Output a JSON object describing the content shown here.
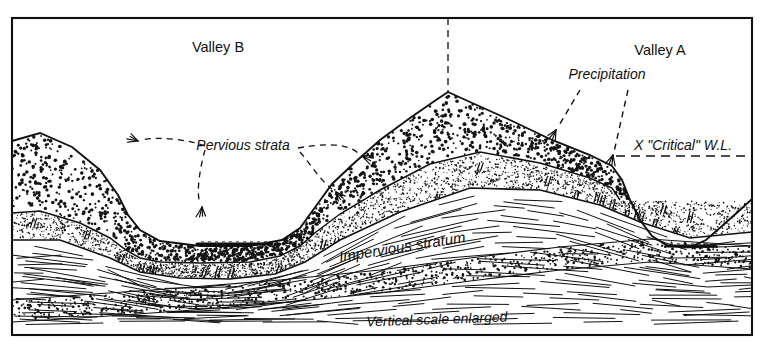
{
  "figure": {
    "title_caption": "Vertical scale enlarged",
    "frame": {
      "x": 12,
      "y": 18,
      "width": 740,
      "height": 317
    },
    "background_color": "#ffffff",
    "ink_color": "#101010"
  },
  "labels": {
    "valley_b": "Valley B",
    "valley_a": "Valley A",
    "precipitation": "Precipitation",
    "pervious_strata": "Pervious strata",
    "impervious_stratum": "Impervious stratum",
    "critical_wl": "X \"Critical\" W.L.",
    "vertical_scale": "Vertical scale enlarged"
  },
  "label_positions": {
    "valley_b": {
      "x": 218,
      "y": 52
    },
    "valley_a": {
      "x": 660,
      "y": 55
    },
    "precipitation": {
      "x": 607,
      "y": 79
    },
    "pervious_strata": {
      "x": 243,
      "y": 150
    },
    "impervious_stratum": {
      "x": 403,
      "y": 252
    },
    "critical_wl": {
      "x": 683,
      "y": 150
    },
    "vertical_scale": {
      "x": 437,
      "y": 324
    }
  },
  "label_styles": {
    "valley_b": {
      "size": 14.5,
      "italic": false,
      "anchor": "middle",
      "rotate": 0
    },
    "valley_a": {
      "size": 14.5,
      "italic": false,
      "anchor": "middle",
      "rotate": 0
    },
    "precipitation": {
      "size": 14,
      "italic": true,
      "anchor": "middle",
      "rotate": 0
    },
    "pervious_strata": {
      "size": 14,
      "italic": true,
      "anchor": "middle",
      "rotate": 0
    },
    "impervious_stratum": {
      "size": 15,
      "italic": true,
      "anchor": "middle",
      "rotate": -9
    },
    "critical_wl": {
      "size": 14,
      "italic": true,
      "anchor": "middle",
      "rotate": 0
    },
    "vertical_scale": {
      "size": 14,
      "italic": true,
      "anchor": "middle",
      "rotate": -2
    }
  },
  "geometry": {
    "ground_surface": "M 12,141 L 40,133 L 72,147 L 100,170 L 118,195 L 128,215 L 140,230 L 160,241 L 200,246 L 250,246 L 282,240 L 300,228 L 316,206 L 332,184 L 352,165 L 380,140 L 410,118 L 436,100 L 448,92 L 470,102 L 510,120 L 552,140 L 590,155 L 612,166 L 622,180 L 630,200 L 640,220 L 652,236 L 668,246 L 690,247 L 706,240 L 722,226 L 740,210 L 752,199",
    "pervious_lower_boundary": "M 12,213 L 40,211 L 80,223 L 110,238 L 126,250 L 140,258 L 160,262 L 200,263 L 250,262 L 280,256 L 300,246 L 316,232 L 340,214 L 380,190 L 430,164 L 480,152 L 540,163 L 590,178 L 612,188 L 620,200",
    "impervious_top": "M 12,240 L 60,240 L 110,258 L 140,272 L 180,278 L 230,279 L 275,274 L 305,262 L 340,240 L 400,212 L 470,188 L 540,190 L 600,205 L 640,222 L 690,238 L 752,232",
    "sand_band_top": "M 12,300 L 80,295 L 180,288 L 280,280 L 380,270 L 470,258 L 560,247 L 650,239 L 752,246",
    "sand_band_bottom": "M 12,322 L 80,318 L 180,311 L 280,303 L 380,293 L 470,281 L 560,270 L 650,262 L 752,269",
    "valley_b_water": {
      "x1": 197,
      "x2": 272,
      "y": 244
    },
    "valley_a_water": {
      "x1": 666,
      "x2": 715,
      "y": 246
    },
    "divider_line": {
      "x": 448,
      "y1": 18,
      "y2": 92
    },
    "critical_wl_line": {
      "x1": 616,
      "x2": 752,
      "y": 156
    }
  },
  "leaders": {
    "pervious_paths": [
      "M 205,146 C 190,140 160,136 142,140",
      "M 205,150 C 200,168 196,192 200,204",
      "M 298,148 C 320,144 346,142 358,153",
      "M 300,152 C 312,166 320,180 332,189"
    ],
    "precip_paths": [
      "M 580,90 L 558,127",
      "M 628,90 L 614,152"
    ],
    "arrow_points": [
      {
        "x": 138,
        "y": 141,
        "angle": 200,
        "name": "pervious-arrow-upper-left"
      },
      {
        "x": 202,
        "y": 207,
        "angle": 95,
        "name": "pervious-arrow-lower-left"
      },
      {
        "x": 362,
        "y": 156,
        "angle": 20,
        "name": "pervious-arrow-upper-right"
      },
      {
        "x": 336,
        "y": 192,
        "angle": 50,
        "name": "pervious-arrow-lower-right"
      },
      {
        "x": 556,
        "y": 130,
        "angle": 120,
        "name": "precipitation-arrow-left"
      },
      {
        "x": 613,
        "y": 155,
        "angle": 105,
        "name": "precipitation-arrow-right"
      }
    ]
  },
  "textures": {
    "coarse_stipple_label": "coarse-dot-stipple",
    "fine_stipple_label": "fine-dot-stipple",
    "hatch_label": "horizontal-hatch-lines",
    "slash_label": "double-slash-marks",
    "coarse_dot_count": 1500,
    "fine_dot_count": 2600,
    "sand_dot_count": 900,
    "hatch_line_count": 150,
    "slash_count": 26
  }
}
